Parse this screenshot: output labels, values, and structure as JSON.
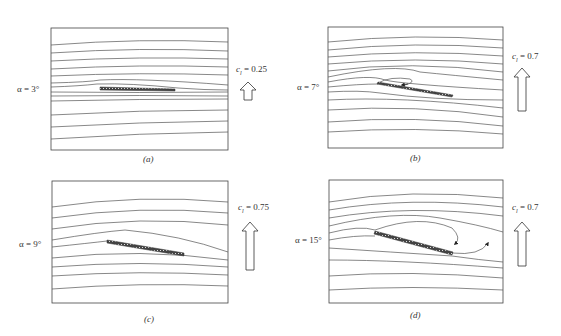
{
  "figure": {
    "panels": [
      {
        "id": "a",
        "caption": "(a)",
        "alpha_label": "α = 3°",
        "cl_symbol": "c",
        "cl_sub": "l",
        "cl_value": "= 0.25",
        "description": "attached flow, small separation bubble at leading edge"
      },
      {
        "id": "b",
        "caption": "(b)",
        "alpha_label": "α = 7°",
        "cl_symbol": "c",
        "cl_sub": "l",
        "cl_value": "= 0.7",
        "description": "leading-edge separation bubble with reattachment"
      },
      {
        "id": "c",
        "caption": "(c)",
        "alpha_label": "α = 9°",
        "cl_symbol": "c",
        "cl_sub": "l",
        "cl_value": "= 0.75",
        "description": "bubble extends along plate"
      },
      {
        "id": "d",
        "caption": "(d)",
        "alpha_label": "α = 15°",
        "cl_symbol": "c",
        "cl_sub": "l",
        "cl_value": "= 0.7",
        "description": "stalled flow with large recirculation wake"
      }
    ],
    "colors": {
      "line": "#4a4a4a",
      "plate": "#555555",
      "background": "#ffffff"
    }
  }
}
